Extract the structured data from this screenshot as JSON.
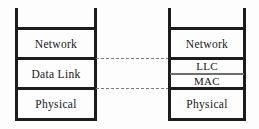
{
  "diagram": {
    "type": "layered-stack-comparison",
    "colors": {
      "line": "#1c1c1c",
      "thin_line": "#6e6e6e",
      "dashed_line": "#7a7a7a",
      "text": "#17171a",
      "background": "#fdfdfd"
    },
    "left_stack": {
      "name": "OSI model lower layers",
      "layers": [
        {
          "label": "Network"
        },
        {
          "label": "Data Link"
        },
        {
          "label": "Physical"
        }
      ]
    },
    "right_stack": {
      "name": "IEEE 802 model lower layers",
      "layers": [
        {
          "label": "Network"
        },
        {
          "label": "LLC"
        },
        {
          "label": "MAC"
        },
        {
          "label": "Physical"
        }
      ]
    },
    "connectors": [
      {
        "name": "network-datalink-boundary"
      },
      {
        "name": "datalink-physical-boundary"
      }
    ]
  }
}
